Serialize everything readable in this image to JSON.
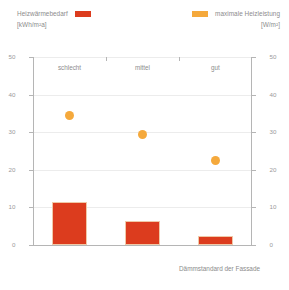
{
  "legend": {
    "left": {
      "label": "Heizwärmebedarf",
      "unit": "[kWh/m²a]",
      "color": "#dc3c1e",
      "swatch_name": "bar-color-swatch"
    },
    "right": {
      "label": "maximale Heizleistung",
      "unit": "[W/m²]",
      "color": "#f5a93c",
      "swatch_name": "marker-color-swatch"
    }
  },
  "axes": {
    "x_title": "Dämmstandard der Fassade",
    "left_ticks": [
      "0",
      "10",
      "20",
      "30",
      "40",
      "50"
    ],
    "right_ticks": [
      "0",
      "10",
      "20",
      "30",
      "40",
      "50"
    ]
  },
  "chart_data": {
    "type": "bar",
    "title": "",
    "subtitle": "",
    "xlabel": "Dämmstandard der Fassade",
    "ylabel": "Heizwärmebedarf [kWh/m²a]",
    "y2label": "maximale Heizleistung [W/m²]",
    "categories": [
      "schlecht",
      "mittel",
      "gut"
    ],
    "ylim": [
      0,
      50
    ],
    "y2lim": [
      0,
      50
    ],
    "yticks": [
      0,
      10,
      20,
      30,
      40,
      50
    ],
    "y2ticks": [
      0,
      10,
      20,
      30,
      40,
      50
    ],
    "grid": true,
    "legend_position": "top",
    "series": [
      {
        "name": "Heizwärmebedarf",
        "unit": "kWh/m²a",
        "type": "bar",
        "color": "#dc3c1e",
        "axis": "left",
        "values": [
          11.5,
          6.5,
          2.5
        ]
      },
      {
        "name": "maximale Heizleistung",
        "unit": "W/m²",
        "type": "scatter",
        "color": "#f5a93c",
        "axis": "right",
        "values": [
          34.5,
          29.5,
          22.5
        ]
      }
    ]
  }
}
